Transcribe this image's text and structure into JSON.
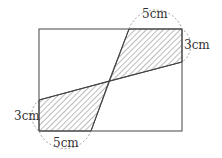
{
  "diagram": {
    "labels": {
      "top_width": "5cm",
      "right_height": "3cm",
      "left_height": "3cm",
      "bottom_width": "5cm"
    },
    "colors": {
      "stroke": "#444444",
      "hatch": "#555555",
      "dashed": "#888888"
    }
  }
}
